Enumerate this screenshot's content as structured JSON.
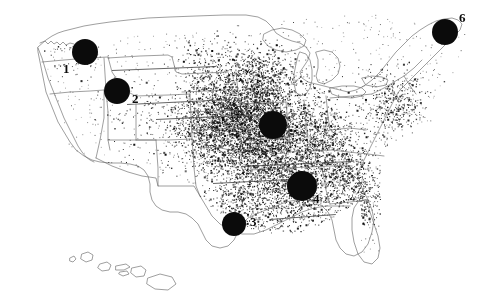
{
  "figure": {
    "kind": "dot-density-map",
    "region": "United States",
    "includes_inset": "Hawaii",
    "background_color": "#ffffff",
    "ink_color": "#0b0b0b",
    "outline_color": "#6b6b6b",
    "width": 477,
    "height": 292
  },
  "markers": [
    {
      "label": "1",
      "cx": 85,
      "cy": 52,
      "r": 13,
      "label_x": 63,
      "label_y": 62,
      "font_size": 13,
      "color": "#0b0b0b"
    },
    {
      "label": "2",
      "cx": 117,
      "cy": 91,
      "r": 13,
      "label_x": 132,
      "label_y": 92,
      "font_size": 13,
      "color": "#0b0b0b"
    },
    {
      "label": "3",
      "cx": 234,
      "cy": 224,
      "r": 12,
      "label_x": 250,
      "label_y": 215,
      "font_size": 13,
      "color": "#0b0b0b"
    },
    {
      "label": "4",
      "cx": 302,
      "cy": 186,
      "r": 15,
      "label_x": 313,
      "label_y": 192,
      "font_size": 13,
      "color": "#0b0b0b"
    },
    {
      "label": "5",
      "cx": 273,
      "cy": 125,
      "r": 14,
      "label_x": 271,
      "label_y": 145,
      "font_size": 13,
      "color": "#0b0b0b"
    },
    {
      "label": "6",
      "cx": 445,
      "cy": 32,
      "r": 13,
      "label_x": 459,
      "label_y": 11,
      "font_size": 13,
      "color": "#0b0b0b"
    }
  ],
  "leader_lines": [
    {
      "x1": 112,
      "y1": 70,
      "x2": 216,
      "y2": 66
    },
    {
      "x1": 127,
      "y1": 104,
      "x2": 232,
      "y2": 99
    },
    {
      "x1": 156,
      "y1": 119,
      "x2": 262,
      "y2": 114
    },
    {
      "x1": 241,
      "y1": 166,
      "x2": 352,
      "y2": 161
    },
    {
      "x1": 213,
      "y1": 183,
      "x2": 290,
      "y2": 179
    },
    {
      "x1": 270,
      "y1": 219,
      "x2": 336,
      "y2": 214
    }
  ],
  "chart_data": {
    "type": "scatter",
    "title": "",
    "xlabel": "",
    "ylabel": "",
    "grid": false,
    "legend": "none",
    "density_clusters": [
      {
        "name": "central-midwest-core",
        "cx": 268,
        "cy": 122,
        "radius": 48,
        "intensity": 1.0
      },
      {
        "name": "corn-belt-west",
        "cx": 232,
        "cy": 118,
        "radius": 40,
        "intensity": 0.85
      },
      {
        "name": "lower-midwest",
        "cx": 258,
        "cy": 158,
        "radius": 42,
        "intensity": 0.72
      },
      {
        "name": "mid-south",
        "cx": 295,
        "cy": 188,
        "radius": 38,
        "intensity": 0.66
      },
      {
        "name": "great-plains-edge",
        "cx": 205,
        "cy": 130,
        "radius": 36,
        "intensity": 0.48
      },
      {
        "name": "ohio-valley",
        "cx": 318,
        "cy": 140,
        "radius": 34,
        "intensity": 0.44
      },
      {
        "name": "upper-midwest",
        "cx": 258,
        "cy": 78,
        "radius": 34,
        "intensity": 0.4
      },
      {
        "name": "southeast-appalachia",
        "cx": 345,
        "cy": 170,
        "radius": 30,
        "intensity": 0.3
      },
      {
        "name": "northeast-corridor",
        "cx": 392,
        "cy": 105,
        "radius": 30,
        "intensity": 0.26
      },
      {
        "name": "texas-gulf",
        "cx": 238,
        "cy": 210,
        "radius": 28,
        "intensity": 0.22
      },
      {
        "name": "southeast-coastal",
        "cx": 360,
        "cy": 200,
        "radius": 26,
        "intensity": 0.16
      },
      {
        "name": "northern-plains",
        "cx": 205,
        "cy": 70,
        "radius": 30,
        "intensity": 0.14
      },
      {
        "name": "mountain-west",
        "cx": 140,
        "cy": 110,
        "radius": 34,
        "intensity": 0.05
      },
      {
        "name": "pacific-northwest",
        "cx": 75,
        "cy": 55,
        "radius": 26,
        "intensity": 0.04
      },
      {
        "name": "southwest-desert",
        "cx": 120,
        "cy": 175,
        "radius": 30,
        "intensity": 0.03
      }
    ],
    "total_points_rendered": 9000,
    "xlim": [
      0,
      477
    ],
    "ylim": [
      0,
      292
    ]
  }
}
